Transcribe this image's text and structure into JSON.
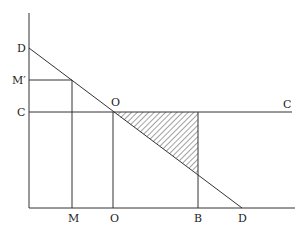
{
  "diagram": {
    "labels": {
      "d_top": "D",
      "m_prime": "M′",
      "c_left": "C",
      "o_top": "O",
      "c_right": "C",
      "m_bottom": "M",
      "o_bottom": "O",
      "b_bottom": "B",
      "d_bottom": "D"
    },
    "colors": {
      "line": "#333333",
      "hatch": "#444444",
      "background": "#ffffff"
    }
  }
}
